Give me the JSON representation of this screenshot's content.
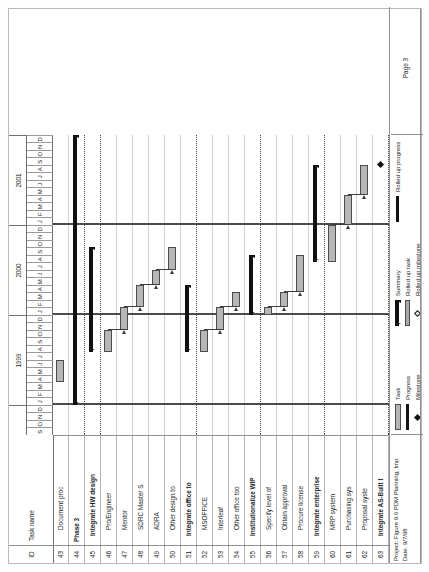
{
  "document": {
    "project_label": "Project: Figure 9.6 PDM Planning, Imp",
    "date_label": "Date: 9/7/98",
    "page_label": "Page 3"
  },
  "table": {
    "headers": {
      "id": "ID",
      "task_name": "Task name"
    },
    "rows": [
      {
        "id": "43",
        "name": "Document proc",
        "level": 3,
        "bold": false
      },
      {
        "id": "44",
        "name": "Phase 3",
        "level": 1,
        "bold": true
      },
      {
        "id": "45",
        "name": "Integrate HW design",
        "level": 2,
        "bold": true
      },
      {
        "id": "46",
        "name": "Pro/Engineer",
        "level": 3,
        "bold": false
      },
      {
        "id": "47",
        "name": "Mentor",
        "level": 3,
        "bold": false
      },
      {
        "id": "48",
        "name": "SDRC Master S",
        "level": 3,
        "bold": false
      },
      {
        "id": "49",
        "name": "ADRA",
        "level": 3,
        "bold": false
      },
      {
        "id": "50",
        "name": "Other design to",
        "level": 3,
        "bold": false
      },
      {
        "id": "51",
        "name": "Integrate office to",
        "level": 2,
        "bold": true
      },
      {
        "id": "52",
        "name": "MSOFFICE",
        "level": 3,
        "bold": false
      },
      {
        "id": "53",
        "name": "Interleaf",
        "level": 3,
        "bold": false
      },
      {
        "id": "54",
        "name": "Other office too",
        "level": 3,
        "bold": false
      },
      {
        "id": "55",
        "name": "Institutionalize WIP",
        "level": 2,
        "bold": true
      },
      {
        "id": "56",
        "name": "Specify level of",
        "level": 3,
        "bold": false
      },
      {
        "id": "57",
        "name": "Obtain approval",
        "level": 3,
        "bold": false
      },
      {
        "id": "58",
        "name": "Procure license",
        "level": 3,
        "bold": false
      },
      {
        "id": "59",
        "name": "Integrate enterprise",
        "level": 2,
        "bold": true
      },
      {
        "id": "60",
        "name": "MRP system",
        "level": 3,
        "bold": false
      },
      {
        "id": "61",
        "name": "Purchasing sys",
        "level": 3,
        "bold": false
      },
      {
        "id": "62",
        "name": "Proposal syste",
        "level": 3,
        "bold": false
      },
      {
        "id": "63",
        "name": "Integrate AS-Built I",
        "level": 2,
        "bold": true
      }
    ]
  },
  "timeline": {
    "years": [
      {
        "label": "",
        "months": [
          "S",
          "O",
          "N",
          "D"
        ]
      },
      {
        "label": "1999",
        "months": [
          "J",
          "F",
          "M",
          "A",
          "M",
          "J",
          "J",
          "A",
          "S",
          "O",
          "N",
          "D"
        ]
      },
      {
        "label": "2000",
        "months": [
          "J",
          "F",
          "M",
          "A",
          "M",
          "J",
          "J",
          "A",
          "S",
          "O",
          "N",
          "D"
        ]
      },
      {
        "label": "2001",
        "months": [
          "J",
          "F",
          "M",
          "A",
          "M",
          "J",
          "J",
          "A",
          "S",
          "O",
          "N",
          "D"
        ]
      }
    ]
  },
  "legend": {
    "column1": [
      {
        "key": "task",
        "label": "Task"
      },
      {
        "key": "progress",
        "label": "Progress"
      },
      {
        "key": "milestone",
        "label": "Milestone"
      }
    ],
    "column2": [
      {
        "key": "summary",
        "label": "Summary"
      },
      {
        "key": "rolled-up-task",
        "label": "Rolled up task"
      },
      {
        "key": "rolled-up-milestone",
        "label": "Rolled up milestone"
      }
    ],
    "column3": [
      {
        "key": "rolled-up-progress",
        "label": "Rolled up progress"
      }
    ]
  },
  "chart_data": {
    "type": "bar",
    "title": "Figure 9.6 PDM Planning, Imp",
    "xlabel": "",
    "ylabel": "",
    "axis_unit": "month",
    "x_start": "1998-09",
    "x_end": "2001-12",
    "grid": true,
    "categories": [
      "Document proc",
      "Phase 3",
      "Integrate HW design",
      "Pro/Engineer",
      "Mentor",
      "SDRC Master S",
      "ADRA",
      "Other design to",
      "Integrate office to",
      "MSOFFICE",
      "Interleaf",
      "Other office too",
      "Institutionalize WIP",
      "Specify level of",
      "Obtain approval",
      "Procure license",
      "Integrate enterprise",
      "MRP system",
      "Purchasing sys",
      "Proposal syste",
      "Integrate AS-Built I"
    ],
    "bars": [
      {
        "row": 0,
        "id": "43",
        "kind": "task",
        "start_month": 7,
        "duration": 3,
        "progress_pct": 0
      },
      {
        "row": 1,
        "id": "44",
        "kind": "summary",
        "start_month": 4,
        "duration": 36,
        "progress_pct": 0
      },
      {
        "row": 2,
        "id": "45",
        "kind": "summary",
        "start_month": 11,
        "duration": 14,
        "progress_pct": 0
      },
      {
        "row": 3,
        "id": "46",
        "kind": "task",
        "start_month": 11,
        "duration": 3,
        "progress_pct": 0
      },
      {
        "row": 4,
        "id": "47",
        "kind": "task",
        "start_month": 14,
        "duration": 3,
        "progress_pct": 0
      },
      {
        "row": 5,
        "id": "48",
        "kind": "task",
        "start_month": 17,
        "duration": 3,
        "progress_pct": 0
      },
      {
        "row": 6,
        "id": "49",
        "kind": "task",
        "start_month": 20,
        "duration": 2,
        "progress_pct": 0
      },
      {
        "row": 7,
        "id": "50",
        "kind": "task",
        "start_month": 22,
        "duration": 3,
        "progress_pct": 0
      },
      {
        "row": 8,
        "id": "51",
        "kind": "summary",
        "start_month": 11,
        "duration": 9,
        "progress_pct": 0
      },
      {
        "row": 9,
        "id": "52",
        "kind": "task",
        "start_month": 11,
        "duration": 3,
        "progress_pct": 0
      },
      {
        "row": 10,
        "id": "53",
        "kind": "task",
        "start_month": 14,
        "duration": 3,
        "progress_pct": 0
      },
      {
        "row": 11,
        "id": "54",
        "kind": "task",
        "start_month": 17,
        "duration": 2,
        "progress_pct": 0
      },
      {
        "row": 12,
        "id": "55",
        "kind": "summary",
        "start_month": 16,
        "duration": 8,
        "progress_pct": 0
      },
      {
        "row": 13,
        "id": "56",
        "kind": "task",
        "start_month": 16,
        "duration": 1,
        "progress_pct": 0
      },
      {
        "row": 14,
        "id": "57",
        "kind": "task",
        "start_month": 17,
        "duration": 2,
        "progress_pct": 0
      },
      {
        "row": 15,
        "id": "58",
        "kind": "task",
        "start_month": 19,
        "duration": 5,
        "progress_pct": 0
      },
      {
        "row": 16,
        "id": "59",
        "kind": "summary",
        "start_month": 23,
        "duration": 13,
        "progress_pct": 0
      },
      {
        "row": 17,
        "id": "60",
        "kind": "task",
        "start_month": 23,
        "duration": 5,
        "progress_pct": 0
      },
      {
        "row": 18,
        "id": "61",
        "kind": "task",
        "start_month": 28,
        "duration": 4,
        "progress_pct": 0
      },
      {
        "row": 19,
        "id": "62",
        "kind": "task",
        "start_month": 32,
        "duration": 4,
        "progress_pct": 0
      },
      {
        "row": 20,
        "id": "63",
        "kind": "task",
        "start_month": 36,
        "duration": 0,
        "progress_pct": 0
      }
    ],
    "links": [
      {
        "from": 3,
        "to": 4
      },
      {
        "from": 4,
        "to": 5
      },
      {
        "from": 5,
        "to": 6
      },
      {
        "from": 6,
        "to": 7
      },
      {
        "from": 9,
        "to": 10
      },
      {
        "from": 10,
        "to": 11
      },
      {
        "from": 13,
        "to": 14
      },
      {
        "from": 14,
        "to": 15
      },
      {
        "from": 17,
        "to": 18
      },
      {
        "from": 18,
        "to": 19
      }
    ]
  }
}
